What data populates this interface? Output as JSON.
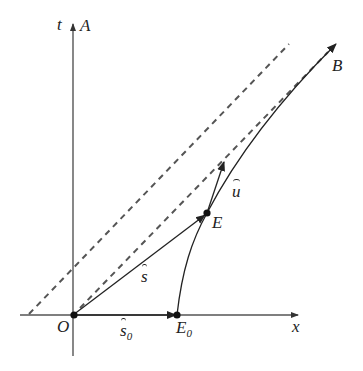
{
  "diagram": {
    "type": "spacetime-diagram",
    "axes": {
      "t_label": "t",
      "x_label": "x",
      "worldline_A_label": "A"
    },
    "points": {
      "origin": "O",
      "E": "E",
      "E0_base": "E",
      "E0_sub": "0",
      "B": "B"
    },
    "vectors": {
      "s_hat": "s",
      "s0_hat_base": "s",
      "s0_hat_sub": "0",
      "u_hat": "u"
    },
    "colors": {
      "axis": "#555555",
      "line": "#222222",
      "dashed": "#555555"
    }
  }
}
